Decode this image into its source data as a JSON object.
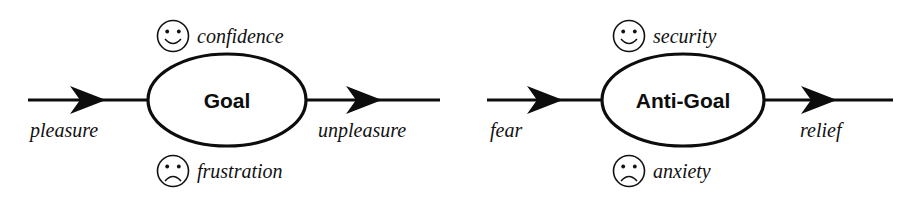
{
  "figure": {
    "type": "diagram",
    "background_color": "#ffffff",
    "ink_color": "#0d0d0d"
  },
  "diagrams": [
    {
      "id": "goal",
      "node_label": "Goal",
      "positive": {
        "icon": "smiley-face-icon",
        "label": "confidence"
      },
      "negative": {
        "icon": "frowny-face-icon",
        "label": "frustration"
      },
      "inflow_label": "pleasure",
      "outflow_label": "unpleasure"
    },
    {
      "id": "anti-goal",
      "node_label": "Anti-Goal",
      "positive": {
        "icon": "smiley-face-icon",
        "label": "security"
      },
      "negative": {
        "icon": "frowny-face-icon",
        "label": "anxiety"
      },
      "inflow_label": "fear",
      "outflow_label": "relief"
    }
  ]
}
